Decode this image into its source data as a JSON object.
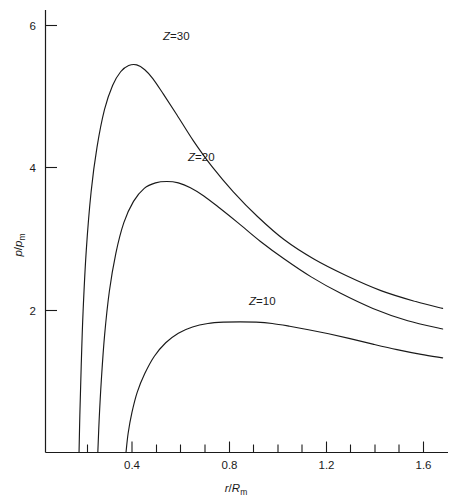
{
  "chart_data": {
    "type": "line",
    "title": "",
    "xlabel": "r/R_m",
    "ylabel": "p/p_m",
    "xlim": [
      0.22,
      1.72
    ],
    "ylim": [
      0.0,
      6.45
    ],
    "grid": false,
    "legend": "inline-labels",
    "xticks": [
      0.4,
      0.8,
      1.2,
      1.6
    ],
    "xticklabels": [
      "0.4",
      "0.8",
      "1.2",
      "1.6"
    ],
    "xminorticks": [
      0.3,
      0.5,
      0.6,
      0.7,
      0.9,
      1.0,
      1.1,
      1.3,
      1.4,
      1.5,
      1.7
    ],
    "yticks": [
      2,
      4,
      6
    ],
    "yticklabels": [
      "2",
      "4",
      "6"
    ],
    "series": [
      {
        "name": "Z=30",
        "label": "Z=30",
        "label_x": 0.62,
        "label_y": 6.08,
        "peak_x": 0.57,
        "peak_y": 5.65,
        "x": [
          0.345,
          0.348,
          0.353,
          0.36,
          0.372,
          0.39,
          0.412,
          0.44,
          0.47,
          0.5,
          0.53,
          0.56,
          0.59,
          0.62,
          0.66,
          0.71,
          0.77,
          0.84,
          0.92,
          1.01,
          1.11,
          1.22,
          1.34,
          1.47,
          1.6,
          1.7
        ],
        "y": [
          0.0,
          0.55,
          1.25,
          2.05,
          2.95,
          3.8,
          4.45,
          5.0,
          5.35,
          5.55,
          5.64,
          5.65,
          5.58,
          5.45,
          5.22,
          4.92,
          4.55,
          4.17,
          3.8,
          3.44,
          3.1,
          2.82,
          2.58,
          2.36,
          2.2,
          2.1
        ]
      },
      {
        "name": "Z=20",
        "label": "Z=20",
        "label_x": 0.8,
        "label_y": 4.38,
        "peak_x": 0.72,
        "peak_y": 3.95,
        "x": [
          0.415,
          0.42,
          0.428,
          0.44,
          0.458,
          0.482,
          0.512,
          0.548,
          0.588,
          0.63,
          0.672,
          0.715,
          0.76,
          0.81,
          0.87,
          0.94,
          1.02,
          1.11,
          1.21,
          1.32,
          1.44,
          1.57,
          1.7
        ],
        "y": [
          0.0,
          0.48,
          1.05,
          1.7,
          2.35,
          2.9,
          3.35,
          3.66,
          3.85,
          3.93,
          3.95,
          3.93,
          3.86,
          3.74,
          3.56,
          3.34,
          3.08,
          2.82,
          2.56,
          2.32,
          2.1,
          1.92,
          1.8
        ]
      },
      {
        "name": "Z=10",
        "label": "Z=10",
        "label_x": 1.07,
        "label_y": 2.27,
        "peak_x": 1.0,
        "peak_y": 1.9,
        "x": [
          0.52,
          0.528,
          0.542,
          0.562,
          0.59,
          0.625,
          0.668,
          0.715,
          0.768,
          0.825,
          0.885,
          0.945,
          1.005,
          1.065,
          1.13,
          1.2,
          1.275,
          1.355,
          1.44,
          1.53,
          1.62,
          1.7
        ],
        "y": [
          0.0,
          0.28,
          0.58,
          0.88,
          1.15,
          1.4,
          1.6,
          1.74,
          1.83,
          1.88,
          1.9,
          1.905,
          1.9,
          1.88,
          1.84,
          1.79,
          1.73,
          1.66,
          1.58,
          1.5,
          1.43,
          1.38
        ]
      }
    ]
  },
  "labels": {
    "y_axis_num": "p",
    "y_axis_den": "p",
    "y_axis_den_sub": "m",
    "x_axis_num": "r",
    "x_axis_den": "R",
    "x_axis_den_sub": "m",
    "slash": "/",
    "z30_var": "Z",
    "z30_eq": "=30",
    "z20_var": "Z",
    "z20_eq": "=20",
    "z10_var": "Z",
    "z10_eq": "=10",
    "ytick_6": "6",
    "ytick_4": "4",
    "ytick_2": "2",
    "xtick_04": "0.4",
    "xtick_08": "0.8",
    "xtick_12": "1.2",
    "xtick_16": "1.6"
  },
  "colors": {
    "ink": "#1a1a1a",
    "background": "#ffffff"
  }
}
